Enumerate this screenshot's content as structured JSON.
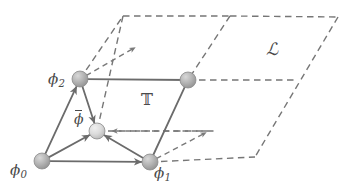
{
  "figure": {
    "colors": {
      "solid_edge": "#6b6b6b",
      "dashed_edge": "#767676",
      "node_fill": "#b0b0b0",
      "node_fill_light": "#d5d5d5",
      "node_stroke": "#8a8a8a",
      "label_text": "#4a4a4a",
      "background": "#ffffff"
    },
    "labels": {
      "phi0": {
        "base": "ϕ",
        "sub": "0"
      },
      "phi1": {
        "base": "ϕ",
        "sub": "1"
      },
      "phi2": {
        "base": "ϕ",
        "sub": "2"
      },
      "phibar": {
        "base": "ϕ",
        "sub": ""
      },
      "torus": "𝕋",
      "lattice": "ℒ"
    },
    "nodes": [
      {
        "name": "node-phi0",
        "label": "phi0",
        "x": 42,
        "y": 161,
        "r": 8.0,
        "shade": "dark"
      },
      {
        "name": "node-phi1",
        "label": "phi1",
        "x": 150,
        "y": 162,
        "r": 8.0,
        "shade": "dark"
      },
      {
        "name": "node-phi2",
        "label": "phi2",
        "x": 80,
        "y": 79,
        "r": 8.0,
        "shade": "dark"
      },
      {
        "name": "node-corner",
        "label": "",
        "x": 188,
        "y": 80,
        "r": 8.0,
        "shade": "dark"
      },
      {
        "name": "node-phibar",
        "label": "phibar",
        "x": 97,
        "y": 131,
        "r": 8.0,
        "shade": "light"
      }
    ],
    "solid_edges": [
      {
        "name": "edge-phi0-phi2",
        "x1": 42,
        "y1": 161,
        "x2": 80,
        "y2": 79,
        "arrow": true
      },
      {
        "name": "edge-phi0-phi1",
        "x1": 42,
        "y1": 161,
        "x2": 150,
        "y2": 162,
        "arrow": true
      },
      {
        "name": "edge-phi0-phibar",
        "x1": 42,
        "y1": 161,
        "x2": 97,
        "y2": 131,
        "arrow": true
      },
      {
        "name": "edge-phi1-phibar",
        "x1": 150,
        "y1": 162,
        "x2": 97,
        "y2": 131,
        "arrow": true
      },
      {
        "name": "edge-phi2-phibar",
        "x1": 80,
        "y1": 79,
        "x2": 97,
        "y2": 131,
        "arrow": true
      },
      {
        "name": "edge-phi2-corner",
        "x1": 80,
        "y1": 79,
        "x2": 188,
        "y2": 80,
        "arrow": false
      },
      {
        "name": "edge-corner-phi1",
        "x1": 188,
        "y1": 80,
        "x2": 150,
        "y2": 162,
        "arrow": false
      }
    ],
    "dashed_edges": [
      {
        "name": "lattice-edge-left-upper",
        "x1": 80,
        "y1": 79,
        "x2": 123,
        "y2": 16
      },
      {
        "name": "lattice-edge-top-left",
        "x1": 123,
        "y1": 16,
        "x2": 230,
        "y2": 16
      },
      {
        "name": "lattice-edge-top-right",
        "x1": 230,
        "y1": 16,
        "x2": 338,
        "y2": 17
      },
      {
        "name": "lattice-edge-mid-diagonal",
        "x1": 230,
        "y1": 16,
        "x2": 188,
        "y2": 80
      },
      {
        "name": "lattice-edge-right-diag",
        "x1": 338,
        "y1": 17,
        "x2": 255,
        "y2": 157
      },
      {
        "name": "lattice-edge-mid-horiz",
        "x1": 188,
        "y1": 80,
        "x2": 297,
        "y2": 80
      },
      {
        "name": "lattice-edge-bottom-horiz",
        "x1": 150,
        "y1": 162,
        "x2": 255,
        "y2": 157
      },
      {
        "name": "lattice-edge-lower-horiz",
        "x1": 97,
        "y1": 131,
        "x2": 214,
        "y2": 131
      },
      {
        "name": "lattice-edge-phi2-down",
        "x1": 123,
        "y1": 16,
        "x2": 97,
        "y2": 131
      }
    ],
    "dashed_arrows": [
      {
        "name": "basis-vector-arrow-upper",
        "x1": 80,
        "y1": 79,
        "x2": 136,
        "y2": 47
      },
      {
        "name": "basis-vector-arrow-lower",
        "x1": 150,
        "y1": 162,
        "x2": 207,
        "y2": 132
      },
      {
        "name": "wrap-arrow-horizontal",
        "x1": 214,
        "y1": 131,
        "x2": 111,
        "y2": 131
      }
    ]
  }
}
